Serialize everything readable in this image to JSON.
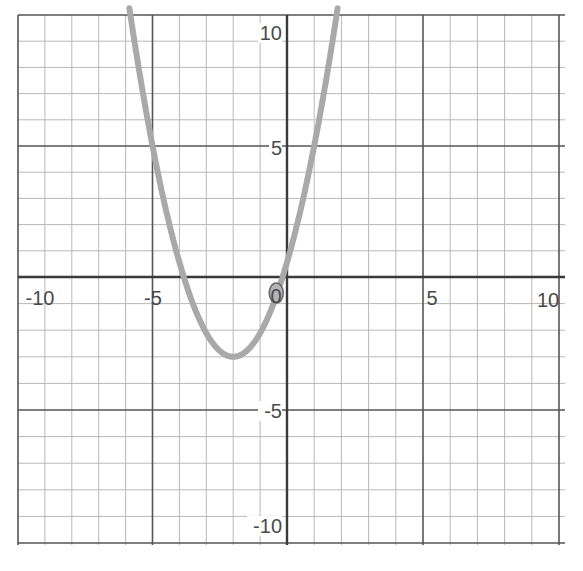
{
  "chart_data": {
    "type": "line",
    "title": "",
    "xlabel": "",
    "ylabel": "",
    "xlim": [
      -10,
      10
    ],
    "ylim": [
      -10,
      10
    ],
    "grid": true,
    "grid_step": 1,
    "major_step": 5,
    "x_tick_labels": [
      "-10",
      "-5",
      "0",
      "5",
      "10"
    ],
    "y_tick_labels": [
      "10",
      "5",
      "-5",
      "-10"
    ],
    "series": [
      {
        "name": "parabola",
        "equation": "y = 0.89(x + 2)^2 - 3",
        "vertex": [
          -2,
          -3
        ],
        "x_intercepts": [
          -3.84,
          -0.16
        ],
        "y_intercept": 0.56,
        "points": [
          {
            "x": -5.6,
            "y": 8.5
          },
          {
            "x": -5,
            "y": 5
          },
          {
            "x": -4,
            "y": 0.56
          },
          {
            "x": -3,
            "y": -2.11
          },
          {
            "x": -2,
            "y": -3
          },
          {
            "x": -1,
            "y": -2.11
          },
          {
            "x": 0,
            "y": 0.56
          },
          {
            "x": 1,
            "y": 5
          },
          {
            "x": 1.8,
            "y": 9.9
          }
        ],
        "color": "#a9a9a9"
      }
    ],
    "annotations": [
      {
        "type": "circle",
        "x": -0.4,
        "y": -0.6,
        "label": "circled point near origin"
      }
    ]
  },
  "colors": {
    "background": "#ffffff",
    "axis": "#3a3a3a",
    "major_grid": "#555555",
    "minor_grid": "#b8b8b8",
    "curve": "#a9a9a9",
    "label": "#4a4a4a"
  }
}
